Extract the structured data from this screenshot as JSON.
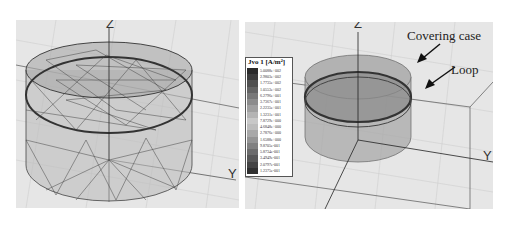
{
  "left_view": {
    "axis_z": "Z",
    "axis_y": "Y",
    "description": "wireframe mesh of cylindrical coil model"
  },
  "right_view": {
    "axis_z": "Z",
    "axis_y": "Y",
    "annotations": {
      "covering_case": "Covering case",
      "loop": "Loop"
    }
  },
  "legend": {
    "title": "Jvo 1 [A/m²]",
    "values": [
      "5.0088e+002",
      "2.9803e+002",
      "1.7735e+002",
      "1.0553e+002",
      "6.2796e+001",
      "3.7367e+001",
      "2.2235e+001",
      "1.3231e+001",
      "7.8729e+000",
      "4.6848e+000",
      "2.7876e+000",
      "1.6588e+000",
      "9.8705e-001",
      "5.8734e-001",
      "3.4949e-001",
      "2.0797e-001",
      "1.2375e-001"
    ],
    "colors": [
      "#2a2a2a",
      "#3c3c3c",
      "#505050",
      "#646464",
      "#787878",
      "#8c8c8c",
      "#a0a0a0",
      "#b4b4b4",
      "#c8c8c8",
      "#bcbcbc",
      "#a8a8a8",
      "#949494",
      "#808080",
      "#6c6c6c",
      "#585858",
      "#444444",
      "#303030"
    ]
  }
}
